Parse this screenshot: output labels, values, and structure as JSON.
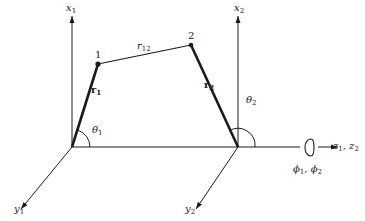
{
  "diagram": {
    "type": "two-body coordinate frame diagram",
    "colors": {
      "line": "#1a1a1a",
      "background": "#ffffff"
    },
    "points": [
      {
        "id": "1",
        "label": "1"
      },
      {
        "id": "2",
        "label": "2"
      }
    ],
    "vectors": {
      "r1": {
        "base": "r",
        "sub": "1"
      },
      "r2": {
        "base": "r",
        "sub": "2"
      },
      "r12": {
        "base": "r",
        "sub": "12"
      }
    },
    "axes": {
      "x1": {
        "base": "x",
        "sub": "1"
      },
      "x2": {
        "base": "x",
        "sub": "2"
      },
      "y1": {
        "base": "y",
        "sub": "1"
      },
      "y2": {
        "base": "y",
        "sub": "2"
      },
      "z": {
        "text": "z",
        "sub1": "1",
        "sep": ", z",
        "sub2": "2"
      }
    },
    "angles": {
      "theta1": {
        "base": "θ",
        "sub": "1"
      },
      "theta2": {
        "base": "θ",
        "sub": "2"
      }
    },
    "rotation": {
      "text": "ϕ",
      "sub1": "1",
      "sep": ", ϕ",
      "sub2": "2",
      "icon": "rotation-arrow-icon"
    }
  }
}
